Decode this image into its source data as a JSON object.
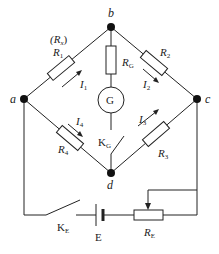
{
  "diagram": {
    "colors": {
      "line": "#222222",
      "background": "#ffffff"
    },
    "nodes": {
      "a": {
        "label": "a"
      },
      "b": {
        "label": "b"
      },
      "c": {
        "label": "c"
      },
      "d": {
        "label": "d"
      }
    },
    "resistors": {
      "r1": {
        "label": "R",
        "sub": "1",
        "alt_label": "(R",
        "alt_sub": "x",
        "alt_close": ")"
      },
      "r2": {
        "label": "R",
        "sub": "2"
      },
      "r3": {
        "label": "R",
        "sub": "3"
      },
      "r4": {
        "label": "R",
        "sub": "4"
      },
      "rg": {
        "label": "R",
        "sub": "G"
      },
      "re": {
        "label": "R",
        "sub": "E"
      }
    },
    "currents": {
      "i1": {
        "label": "I",
        "sub": "1"
      },
      "i2": {
        "label": "I",
        "sub": "2"
      },
      "i3": {
        "label": "I",
        "sub": "3"
      },
      "i4": {
        "label": "I",
        "sub": "4"
      }
    },
    "galvanometer": {
      "label": "G"
    },
    "switches": {
      "kg": {
        "label": "K",
        "sub": "G"
      },
      "ke": {
        "label": "K",
        "sub": "E"
      }
    },
    "battery": {
      "label": "E"
    }
  }
}
